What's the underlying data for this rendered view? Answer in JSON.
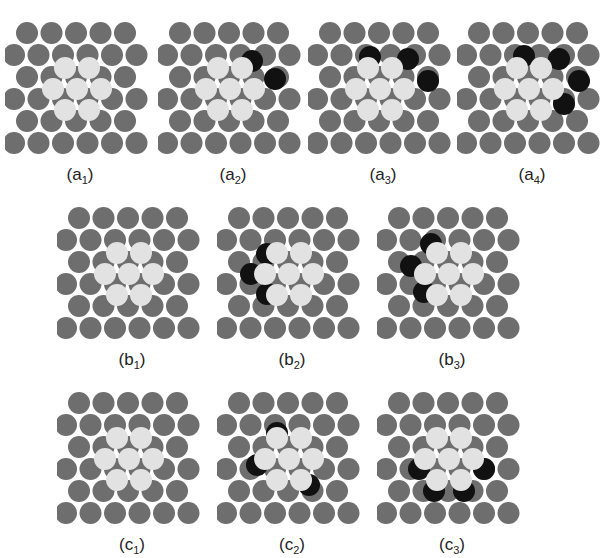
{
  "figure": {
    "colors": {
      "substrate_atom": "#6e6e6e",
      "adatom_light": "#e2e2e2",
      "shifted_atom_dark": "#111111",
      "background": "#ffffff"
    },
    "legend_description": "Hexagonal close-packed atom layers; light circles = 7-atom island, dark (black) circles = displaced atoms"
  },
  "panels": [
    {
      "id": "a1",
      "row": "a",
      "label_letter": "a",
      "label_sub": "1",
      "dark_count": 0
    },
    {
      "id": "a2",
      "row": "a",
      "label_letter": "a",
      "label_sub": "2",
      "dark_count": 2
    },
    {
      "id": "a3",
      "row": "a",
      "label_letter": "a",
      "label_sub": "3",
      "dark_count": 3
    },
    {
      "id": "a4",
      "row": "a",
      "label_letter": "a",
      "label_sub": "4",
      "dark_count": 4
    },
    {
      "id": "b1",
      "row": "b",
      "label_letter": "b",
      "label_sub": "1",
      "dark_count": 0
    },
    {
      "id": "b2",
      "row": "b",
      "label_letter": "b",
      "label_sub": "2",
      "dark_count": 3
    },
    {
      "id": "b3",
      "row": "b",
      "label_letter": "b",
      "label_sub": "3",
      "dark_count": 3
    },
    {
      "id": "c1",
      "row": "c",
      "label_letter": "c",
      "label_sub": "1",
      "dark_count": 0
    },
    {
      "id": "c2",
      "row": "c",
      "label_letter": "c",
      "label_sub": "2",
      "dark_count": 3
    },
    {
      "id": "c3",
      "row": "c",
      "label_letter": "c",
      "label_sub": "3",
      "dark_count": 4
    }
  ]
}
